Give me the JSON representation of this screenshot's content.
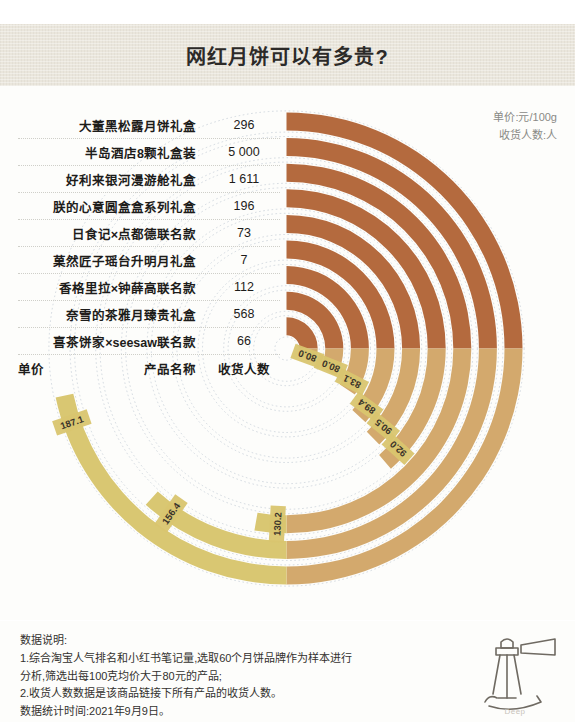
{
  "header": {
    "title": "网红月饼可以有多贵?"
  },
  "legend": {
    "line1": "单价:元/100g",
    "line2": "收货人数:人"
  },
  "table": {
    "columns": {
      "unit": "单价",
      "name": "产品名称",
      "count": "收货人数"
    },
    "rows": [
      {
        "name": "大董黑松露月饼礼盒",
        "count": "296"
      },
      {
        "name": "半岛酒店8颗礼盒装",
        "count": "5 000"
      },
      {
        "name": "好利来银河漫游舱礼盒",
        "count": "1 611"
      },
      {
        "name": "朕的心意圆盒盒系列礼盒",
        "count": "196"
      },
      {
        "name": "日食记×点都德联名款",
        "count": "73"
      },
      {
        "name": "菓然匠子瑶台升明月礼盒",
        "count": "7"
      },
      {
        "name": "香格里拉×钟薛高联名款",
        "count": "112"
      },
      {
        "name": "奈雪的茶雅月臻贵礼盒",
        "count": "568"
      },
      {
        "name": "喜茶饼家×seesaw联名款",
        "count": "66"
      }
    ]
  },
  "chart_data": {
    "type": "bar",
    "variant": "radial-bar",
    "title": "网红月饼可以有多贵?",
    "xlabel": "产品名称",
    "ylabel": "单价 (元/100g)",
    "value_unit": "元/100g",
    "count_unit": "人",
    "start_angle_deg": 0,
    "direction": "clockwise",
    "max_value": 200,
    "grid": true,
    "legend_position": "top-right",
    "categories": [
      "大董黑松露月饼礼盒",
      "半岛酒店8颗礼盒装",
      "好利来银河漫游舱礼盒",
      "朕的心意圆盒盒系列礼盒",
      "日食记×点都德联名款",
      "菓然匠子瑶台升明月礼盒",
      "香格里拉×钟薛高联名款",
      "奈雪的茶雅月臻贵礼盒",
      "喜茶饼家×seesaw联名款"
    ],
    "series": [
      {
        "name": "单价",
        "unit": "元/100g",
        "values": [
          187.1,
          156.4,
          130.2,
          92.0,
          90.5,
          89.4,
          83.1,
          80.0,
          80.0
        ]
      },
      {
        "name": "收货人数",
        "unit": "人",
        "values": [
          296,
          5000,
          1611,
          196,
          73,
          7,
          112,
          568,
          66
        ]
      }
    ],
    "arcs": [
      {
        "label": "187.1",
        "value": 187.1,
        "ring": 0,
        "sweep_deg": 258
      },
      {
        "label": "156.4",
        "value": 156.4,
        "ring": 1,
        "sweep_deg": 222
      },
      {
        "label": "130.2",
        "value": 130.2,
        "ring": 2,
        "sweep_deg": 190
      },
      {
        "label": "92.0",
        "value": 92.0,
        "ring": 3,
        "sweep_deg": 139
      },
      {
        "label": "90.5",
        "value": 90.5,
        "ring": 4,
        "sweep_deg": 136
      },
      {
        "label": "89.4",
        "value": 89.4,
        "ring": 5,
        "sweep_deg": 133
      },
      {
        "label": "83.1",
        "value": 83.1,
        "ring": 6,
        "sweep_deg": 124
      },
      {
        "label": "80.0",
        "value": 80.0,
        "ring": 7,
        "sweep_deg": 119
      },
      {
        "label": "80.0",
        "value": 80.0,
        "ring": 8,
        "sweep_deg": 117
      }
    ],
    "colors": {
      "band_high": "#b46a3e",
      "band_mid": "#d3a96d",
      "band_low": "#d9c772",
      "label_chip": "#d9c56f",
      "gridline": "#b9c3cf",
      "title_band": "#eae6dc",
      "text": "#1d1c1a"
    }
  },
  "footnote": {
    "heading": "数据说明:",
    "line1": "1.综合淘宝人气排名和小红书笔记量,选取60个月饼品牌作为样本进行",
    "line2": "分析,筛选出每100克均价大于80元的产品;",
    "line3": "2.收货人数数据是该商品链接下所有产品的收货人数。",
    "line4": "数据统计时间:2021年9月9日。"
  },
  "logo": {
    "caption": "Deep",
    "icon": "telescope-icon"
  }
}
